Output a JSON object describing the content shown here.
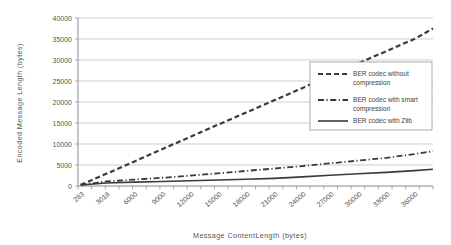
{
  "chart_data": {
    "type": "line",
    "title": "",
    "xlabel": "Message ContentLength (bytes)",
    "ylabel": "Encoded Message Length (bytes)",
    "xlim": [
      0,
      38000
    ],
    "ylim": [
      0,
      40000
    ],
    "grid": true,
    "legend_position": "right-upper",
    "ytick_labels": [
      "0",
      "5000",
      "10000",
      "15000",
      "20000",
      "25000",
      "30000",
      "35000",
      "40000"
    ],
    "ytick_values": [
      0,
      5000,
      10000,
      15000,
      20000,
      25000,
      30000,
      35000,
      40000
    ],
    "xtick_labels": [
      "283",
      "3018",
      "6000",
      "9000",
      "12000",
      "15000",
      "18000",
      "21000",
      "24000",
      "27000",
      "30000",
      "33000",
      "36000"
    ],
    "xtick_values": [
      283,
      3018,
      6000,
      9000,
      12000,
      15000,
      18000,
      21000,
      24000,
      27000,
      30000,
      33000,
      36000
    ],
    "x": [
      283,
      3018,
      6000,
      9000,
      12000,
      15000,
      18000,
      21000,
      24000,
      27000,
      30000,
      33000,
      36000,
      38000
    ],
    "series": [
      {
        "name": "BER codec without compression",
        "style": "dashed",
        "color": "#3a3a3a",
        "values": [
          270,
          2900,
          5800,
          8750,
          11700,
          14600,
          17500,
          20400,
          23300,
          26300,
          29200,
          32100,
          35000,
          37500
        ]
      },
      {
        "name": "BER codec with smart compression",
        "style": "dash-dot",
        "color": "#3a3a3a",
        "values": [
          260,
          1080,
          1530,
          1950,
          2450,
          3000,
          3600,
          4150,
          4750,
          5400,
          6050,
          6700,
          7600,
          8300
        ]
      },
      {
        "name": "BER codec with Zlib",
        "style": "solid",
        "color": "#5a5a5a",
        "values": [
          250,
          700,
          920,
          1080,
          1250,
          1420,
          1600,
          1820,
          2180,
          2550,
          2900,
          3250,
          3650,
          4000
        ]
      }
    ]
  },
  "legend": {
    "items": [
      {
        "label_line1": "BER codec without",
        "label_line2": "compression",
        "style": "dashed"
      },
      {
        "label_line1": "BER codec with smart",
        "label_line2": "compression",
        "style": "dash-dot"
      },
      {
        "label_line1": "BER codec with Zlib",
        "label_line2": "",
        "style": "solid"
      }
    ]
  }
}
